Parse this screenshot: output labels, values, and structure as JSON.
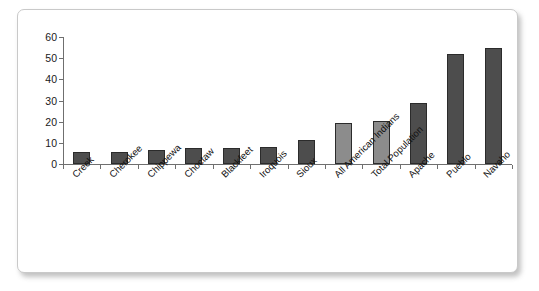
{
  "chart_data": {
    "type": "bar",
    "title": "",
    "xlabel": "",
    "ylabel": "",
    "ylim": [
      0,
      60
    ],
    "yticks": [
      0,
      10,
      20,
      30,
      40,
      50,
      60
    ],
    "grid": false,
    "legend": "none",
    "categories": [
      "Creek",
      "Cherokee",
      "Chippewa",
      "Choctaw",
      "Blackfeet",
      "Iroquois",
      "Sioux",
      "All American Indians",
      "Total Population",
      "Apache",
      "Pueblo",
      "Navaho"
    ],
    "values": [
      5.5,
      5.8,
      6.5,
      7.5,
      7.8,
      8.2,
      11.5,
      19.5,
      20.2,
      29,
      52,
      55
    ],
    "bar_colors": [
      "#4d4d4d",
      "#4d4d4d",
      "#4d4d4d",
      "#4d4d4d",
      "#4d4d4d",
      "#4d4d4d",
      "#4d4d4d",
      "#8c8c8c",
      "#8c8c8c",
      "#4d4d4d",
      "#4d4d4d",
      "#4d4d4d"
    ]
  },
  "colors": {
    "bar_dark": "#4d4d4d",
    "bar_light": "#8c8c8c",
    "bar_border": "#2b2b2b",
    "axis": "#6f6f6f",
    "text": "#111111",
    "frame_border": "#c9c9c9",
    "background": "#ffffff"
  }
}
